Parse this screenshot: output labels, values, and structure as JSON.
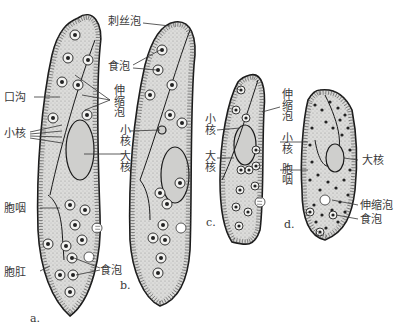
{
  "figure": {
    "specimens": [
      {
        "id": "a",
        "caption": "a."
      },
      {
        "id": "b",
        "caption": "b."
      },
      {
        "id": "c",
        "caption": "c."
      },
      {
        "id": "d",
        "caption": "d."
      }
    ],
    "labels": {
      "trichocyst": "刺丝泡",
      "food_vacuole_b_top": "食泡",
      "contractile_vacuole_ab": "伸缩泡",
      "oral_groove": "口沟",
      "micronucleus_a": "小核",
      "micronucleus_b": "小核",
      "macronucleus_b": "大核",
      "cytopharynx_a": "胞咽",
      "cytoproct_a": "胞肛",
      "food_vacuole_ab_bottom": "食泡",
      "micronucleus_c": "小核",
      "macronucleus_c": "大核",
      "contractile_vacuole_cd": "伸缩泡",
      "micronucleus_cd": "小核",
      "cytopharynx_cd": "胞咽",
      "macronucleus_d": "大核",
      "contractile_vacuole_d": "伸缩泡",
      "food_vacuole_d": "食泡"
    }
  }
}
